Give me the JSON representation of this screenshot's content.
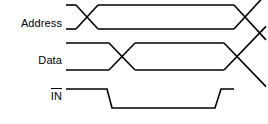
{
  "diagram": {
    "type": "timing-diagram",
    "background_color": "#ffffff",
    "line_color": "#000000",
    "line_width": 1.6,
    "width": 268,
    "height": 124
  },
  "signals": [
    {
      "id": "address",
      "label": "Address",
      "active_low": false,
      "type": "bus",
      "high_y": 5,
      "low_y": 29,
      "start_x": 66,
      "end_x": 266,
      "transitions": [
        {
          "center_x": 87,
          "half_width": 11,
          "kind": "cross"
        },
        {
          "center_x": 245,
          "half_width": 11,
          "kind": "cross"
        }
      ]
    },
    {
      "id": "data",
      "label": "Data",
      "active_low": false,
      "type": "bus",
      "high_y": 43,
      "low_y": 70,
      "start_x": 66,
      "end_x": 266,
      "transitions": [
        {
          "center_x": 122,
          "half_width": 13,
          "kind": "cross"
        },
        {
          "center_x": 237,
          "half_width": 13,
          "kind": "cross"
        }
      ]
    },
    {
      "id": "in",
      "label": "IN",
      "active_low": true,
      "type": "logic",
      "high_y": 89,
      "low_y": 108,
      "start_x": 66,
      "end_x": 234,
      "transitions": [
        {
          "edge_start_x": 107,
          "edge_end_x": 112,
          "kind": "falling"
        },
        {
          "edge_start_x": 215,
          "edge_end_x": 221,
          "kind": "rising"
        }
      ]
    }
  ],
  "chart_data": {
    "type": "line",
    "xlabel": "",
    "ylabel": "",
    "series": [
      {
        "name": "Address",
        "style": "bus",
        "points": [
          {
            "x": 66,
            "level": "high"
          },
          {
            "x": 87,
            "level": "cross"
          },
          {
            "x": 245,
            "level": "cross"
          },
          {
            "x": 266,
            "level": "open"
          }
        ]
      },
      {
        "name": "Data",
        "style": "bus",
        "points": [
          {
            "x": 66,
            "level": "high"
          },
          {
            "x": 122,
            "level": "cross"
          },
          {
            "x": 237,
            "level": "cross"
          },
          {
            "x": 266,
            "level": "open"
          }
        ]
      },
      {
        "name": "IN",
        "style": "logic",
        "points": [
          {
            "x": 66,
            "level": 1
          },
          {
            "x": 107,
            "level": 1
          },
          {
            "x": 112,
            "level": 0
          },
          {
            "x": 215,
            "level": 0
          },
          {
            "x": 221,
            "level": 1
          },
          {
            "x": 234,
            "level": 1
          }
        ]
      }
    ]
  }
}
